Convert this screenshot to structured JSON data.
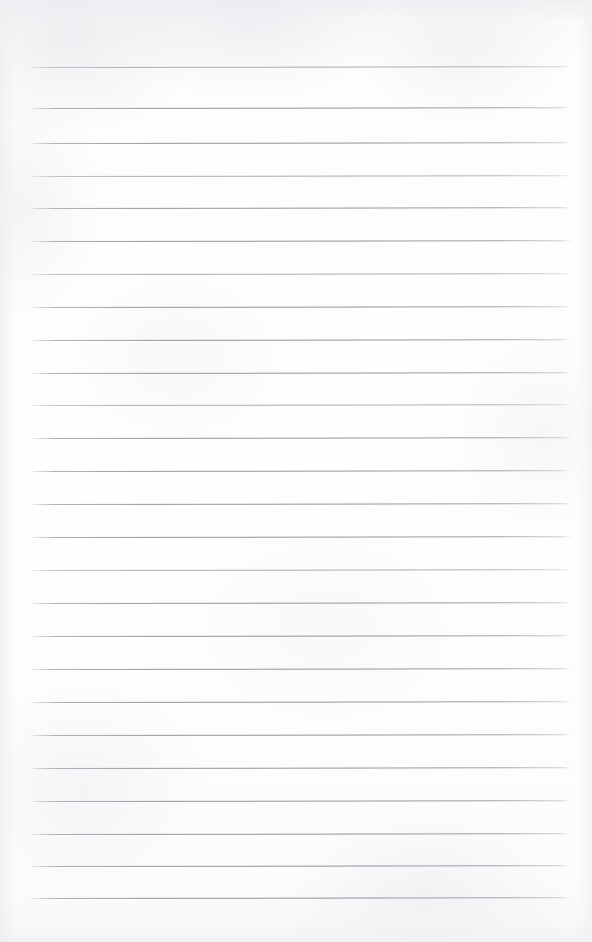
{
  "document": {
    "type": "lined-notebook-page",
    "title": "Blank ruled notebook page",
    "page_width": 592,
    "page_height": 942,
    "content_text": "",
    "is_blank": true
  },
  "paper": {
    "background_color": "#fdfdfd",
    "edge_tint_color": "#eceef0",
    "texture": "subtle mottled scan grain"
  },
  "rules": {
    "line_color": "#92949c",
    "line_thickness_px": 1,
    "left_margin_px": 28,
    "right_margin_px": 573,
    "first_line_y_px": 67,
    "line_spacing_px": 33.1,
    "line_count": 26,
    "skew_degrees": -0.085,
    "lines": [
      {
        "index": 1,
        "y": 67,
        "weight": "faint"
      },
      {
        "index": 2,
        "y": 108,
        "weight": "strong"
      },
      {
        "index": 3,
        "y": 143,
        "weight": "strong"
      },
      {
        "index": 4,
        "y": 176,
        "weight": "faint"
      },
      {
        "index": 5,
        "y": 208,
        "weight": "strong"
      },
      {
        "index": 6,
        "y": 241,
        "weight": "strong"
      },
      {
        "index": 7,
        "y": 274,
        "weight": "faint"
      },
      {
        "index": 8,
        "y": 307,
        "weight": "strong"
      },
      {
        "index": 9,
        "y": 340,
        "weight": "strong"
      },
      {
        "index": 10,
        "y": 373,
        "weight": "strong"
      },
      {
        "index": 11,
        "y": 405,
        "weight": "faint"
      },
      {
        "index": 12,
        "y": 438,
        "weight": "strong"
      },
      {
        "index": 13,
        "y": 471,
        "weight": "strong"
      },
      {
        "index": 14,
        "y": 504,
        "weight": "strong"
      },
      {
        "index": 15,
        "y": 537,
        "weight": "strong"
      },
      {
        "index": 16,
        "y": 570,
        "weight": "faint"
      },
      {
        "index": 17,
        "y": 603,
        "weight": "strong"
      },
      {
        "index": 18,
        "y": 636,
        "weight": "strong"
      },
      {
        "index": 19,
        "y": 669,
        "weight": "strong"
      },
      {
        "index": 20,
        "y": 702,
        "weight": "strong"
      },
      {
        "index": 21,
        "y": 735,
        "weight": "strong"
      },
      {
        "index": 22,
        "y": 768,
        "weight": "strong"
      },
      {
        "index": 23,
        "y": 801,
        "weight": "strong"
      },
      {
        "index": 24,
        "y": 834,
        "weight": "strong"
      },
      {
        "index": 25,
        "y": 866,
        "weight": "strong"
      },
      {
        "index": 26,
        "y": 898,
        "weight": "strong"
      }
    ]
  }
}
